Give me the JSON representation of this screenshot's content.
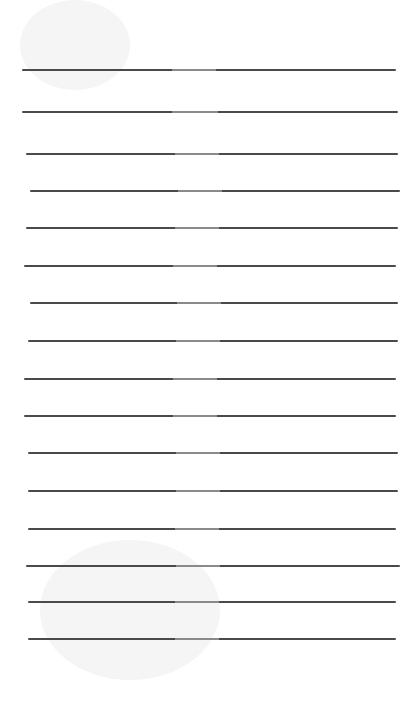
{
  "page": {
    "type": "lined-paper",
    "background": "#ffffff",
    "line_color": "#4a4a4a",
    "lines": [
      {
        "y": 69,
        "x1": 22,
        "x2": 396
      },
      {
        "y": 111,
        "x1": 22,
        "x2": 398
      },
      {
        "y": 153,
        "x1": 26,
        "x2": 398
      },
      {
        "y": 190,
        "x1": 30,
        "x2": 400
      },
      {
        "y": 227,
        "x1": 26,
        "x2": 398
      },
      {
        "y": 265,
        "x1": 24,
        "x2": 396
      },
      {
        "y": 302,
        "x1": 30,
        "x2": 398
      },
      {
        "y": 340,
        "x1": 28,
        "x2": 398
      },
      {
        "y": 378,
        "x1": 24,
        "x2": 396
      },
      {
        "y": 415,
        "x1": 24,
        "x2": 396
      },
      {
        "y": 452,
        "x1": 28,
        "x2": 398
      },
      {
        "y": 490,
        "x1": 28,
        "x2": 398
      },
      {
        "y": 528,
        "x1": 28,
        "x2": 396
      },
      {
        "y": 565,
        "x1": 26,
        "x2": 400
      },
      {
        "y": 601,
        "x1": 28,
        "x2": 396
      },
      {
        "y": 638,
        "x1": 28,
        "x2": 396
      }
    ],
    "watermarks": [
      {
        "x": 20,
        "y": 0,
        "w": 110,
        "h": 90
      },
      {
        "x": 40,
        "y": 540,
        "w": 180,
        "h": 140
      }
    ]
  }
}
